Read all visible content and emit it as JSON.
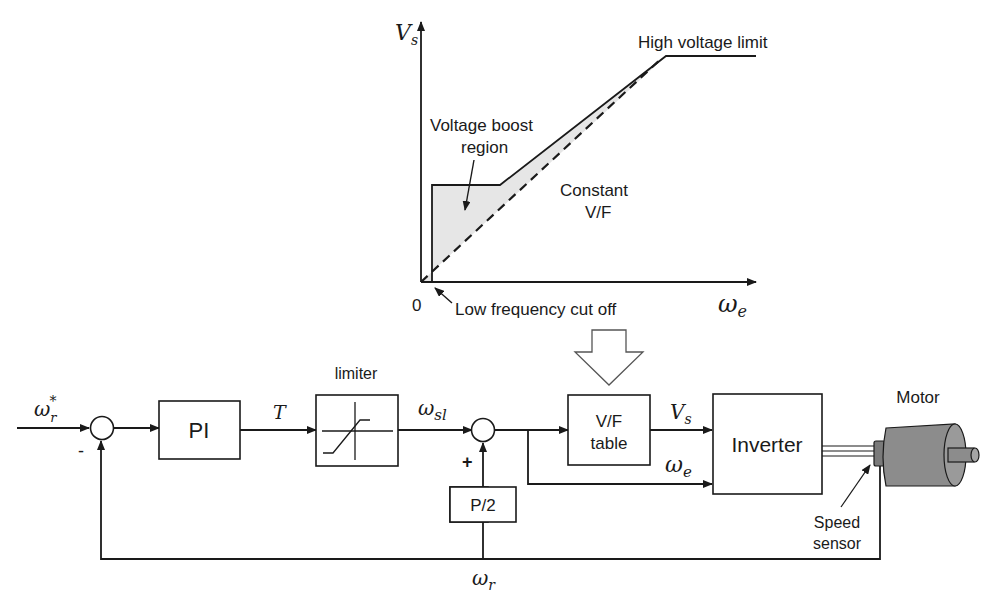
{
  "graph": {
    "y_axis_label": "V",
    "y_axis_sub": "s",
    "x_axis_label": "ω",
    "x_axis_sub": "e",
    "origin_label": "0",
    "annotations": {
      "high_voltage_limit": "High voltage limit",
      "voltage_boost_line1": "Voltage boost",
      "voltage_boost_line2": "region",
      "constant_vf_line1": "Constant",
      "constant_vf_line2": "V/F",
      "low_freq_cutoff": "Low frequency cut off"
    },
    "colors": {
      "boost_fill": "#e6e6e6",
      "line": "#1a1a1a"
    }
  },
  "block_diagram": {
    "input_signal": "ω",
    "input_sub": "r",
    "input_sup": "*",
    "sum1_minus": "-",
    "pi_block": "PI",
    "torque_signal": "T",
    "limiter_label": "limiter",
    "slip_signal": "ω",
    "slip_sub": "sl",
    "sum2_plus": "+",
    "p2_block": "P/2",
    "vf_block_line1": "V/F",
    "vf_block_line2": "table",
    "vs_signal": "V",
    "vs_sub": "s",
    "we_signal": "ω",
    "we_sub": "e",
    "inverter_block": "Inverter",
    "motor_label": "Motor",
    "speed_sensor_line1": "Speed",
    "speed_sensor_line2": "sensor",
    "feedback_signal": "ω",
    "feedback_sub": "r",
    "colors": {
      "motor_body": "#8c8c8c",
      "motor_dark": "#6e6e6e"
    }
  }
}
